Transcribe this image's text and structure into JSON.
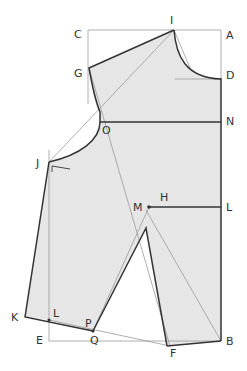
{
  "diagram": {
    "type": "sewing-pattern-bodice",
    "colors": {
      "fill": "#e6e6e6",
      "outline": "#333333",
      "guide": "#999999"
    },
    "labels": {
      "I": "I",
      "C": "C",
      "A": "A",
      "G": "G",
      "D": "D",
      "O": "O",
      "N": "N",
      "J": "J",
      "M": "M",
      "H": "H",
      "L_right": "L",
      "K": "K",
      "L_left": "L",
      "P": "P",
      "E": "E",
      "Q": "Q",
      "F": "F",
      "B": "B"
    }
  }
}
